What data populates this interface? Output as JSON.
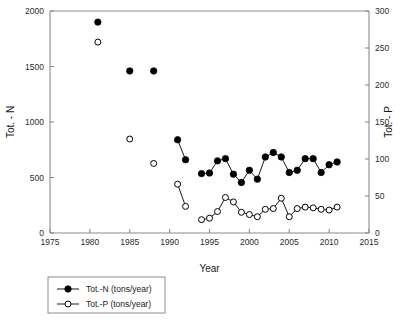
{
  "chart_data": {
    "type": "line",
    "title": "",
    "subtitle": "",
    "xlabel": "Year",
    "ylabel": "Tot. - N",
    "y2label": "Tot. - P",
    "xlim": [
      1975,
      2015
    ],
    "ylim": [
      0,
      2000
    ],
    "y2lim": [
      0,
      300
    ],
    "xticks": [
      1975,
      1980,
      1985,
      1990,
      1995,
      2000,
      2005,
      2010,
      2015
    ],
    "xtick_labels": [
      "1975",
      "1980",
      "1985",
      "1990",
      "1995",
      "2000",
      "2005",
      "2010",
      "2015"
    ],
    "yticks": [
      0,
      500,
      1000,
      1500,
      2000
    ],
    "ytick_labels": [
      "0",
      "500",
      "1000",
      "1500",
      "2000"
    ],
    "y2ticks": [
      0,
      50,
      100,
      150,
      200,
      250,
      300
    ],
    "y2tick_labels": [
      "0",
      "50",
      "100",
      "150",
      "200",
      "250",
      "300"
    ],
    "grid": false,
    "legend_position": "below-left",
    "series": [
      {
        "name": "Tot.-N (tons/year)",
        "axis": "left",
        "marker": "filled-circle",
        "color": "#000000",
        "x": [
          1981,
          1985,
          1988,
          1991,
          1992,
          1994,
          1995,
          1996,
          1997,
          1998,
          1999,
          2000,
          2001,
          2002,
          2003,
          2004,
          2005,
          2006,
          2007,
          2008,
          2009,
          2010,
          2011
        ],
        "values": [
          1900,
          1460,
          1460,
          840,
          660,
          535,
          540,
          650,
          670,
          530,
          455,
          565,
          485,
          685,
          725,
          685,
          545,
          565,
          670,
          670,
          545,
          615,
          640
        ],
        "segments": [
          [
            1991,
            1992
          ],
          [
            1994,
            2011
          ]
        ]
      },
      {
        "name": "Tot.-P (tons/year)",
        "axis": "right",
        "marker": "open-circle",
        "color": "#000000",
        "x": [
          1981,
          1985,
          1988,
          1991,
          1992,
          1994,
          1995,
          1996,
          1997,
          1998,
          1999,
          2000,
          2001,
          2002,
          2003,
          2004,
          2005,
          2006,
          2007,
          2008,
          2009,
          2010,
          2011
        ],
        "values": [
          258,
          127,
          94,
          66,
          36,
          18,
          20,
          29,
          48,
          42,
          28,
          25,
          22,
          32,
          33,
          47,
          22,
          33,
          35,
          34,
          32,
          31,
          35
        ],
        "segments": [
          [
            1991,
            1992
          ],
          [
            1994,
            2011
          ]
        ]
      }
    ],
    "legend": [
      {
        "label": "Tot.-N (tons/year)",
        "marker": "filled-circle"
      },
      {
        "label": "Tot.-P (tons/year)",
        "marker": "open-circle"
      }
    ]
  }
}
